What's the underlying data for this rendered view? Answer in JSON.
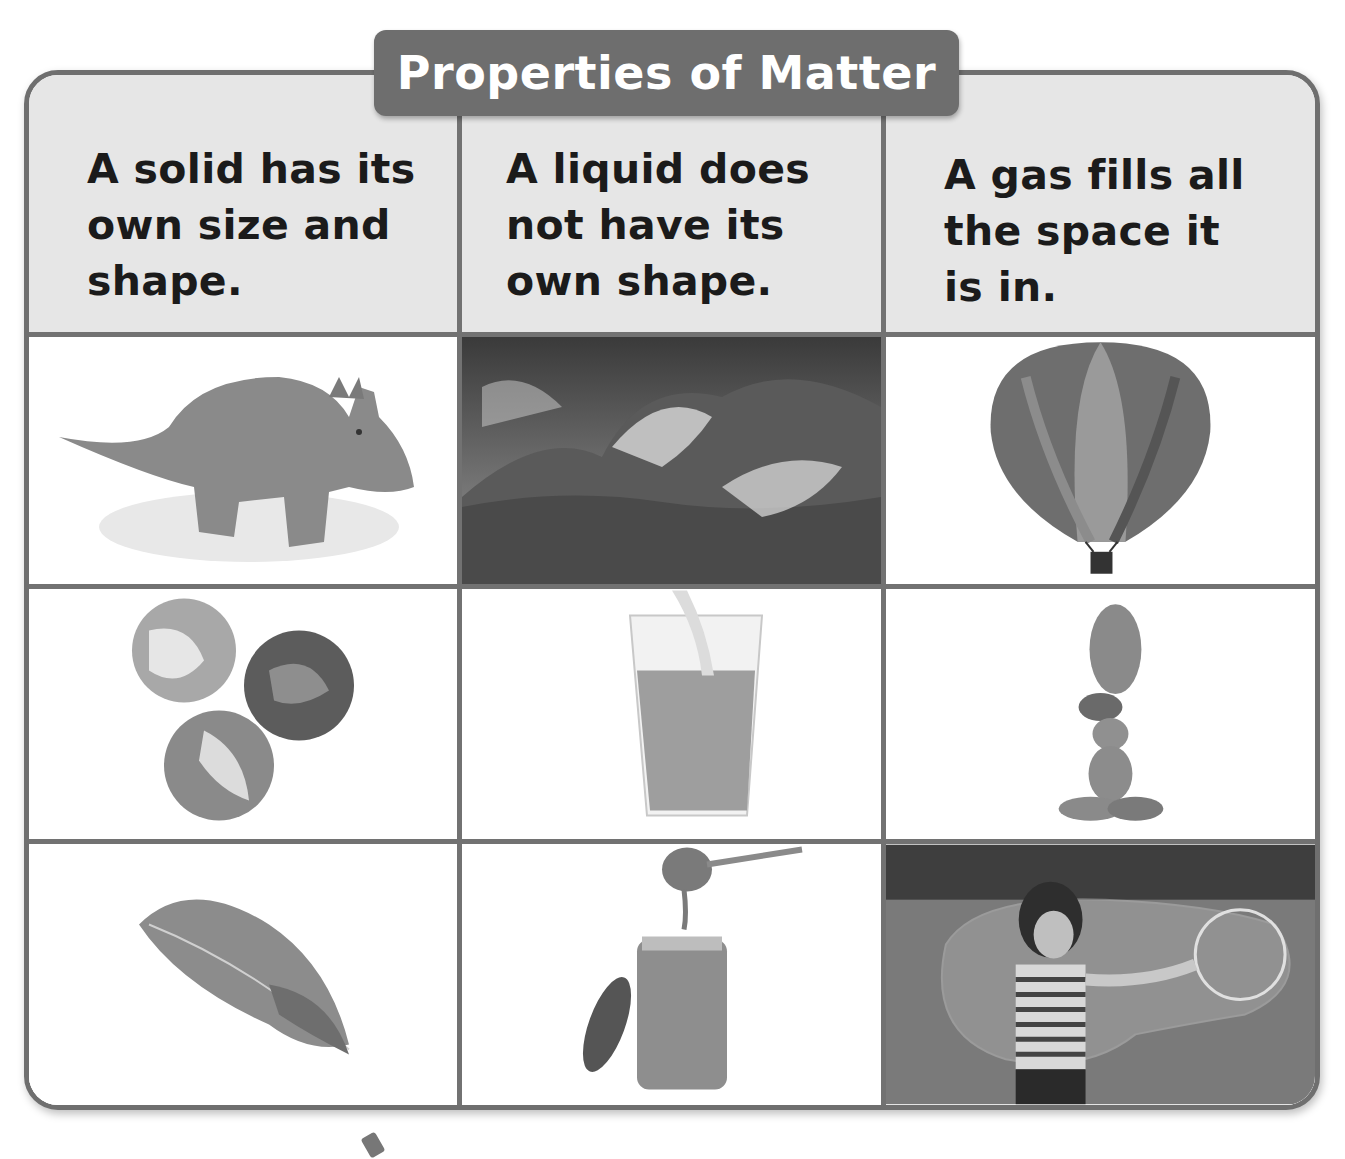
{
  "title": "Properties of Matter",
  "columns": [
    {
      "key": "solid",
      "header": "A solid has its\nown size and\nshape.",
      "images": [
        {
          "name": "toy-dinosaur-image",
          "subject": "toy triceratops dinosaur"
        },
        {
          "name": "marbles-image",
          "subject": "three glass marbles"
        },
        {
          "name": "feather-image",
          "subject": "feather"
        }
      ]
    },
    {
      "key": "liquid",
      "header": "A liquid does\nnot have its\nown shape.",
      "images": [
        {
          "name": "ocean-wave-image",
          "subject": "crashing ocean wave"
        },
        {
          "name": "juice-glass-image",
          "subject": "juice being poured into a glass"
        },
        {
          "name": "honey-jar-image",
          "subject": "honey dripping from dipper into jar"
        }
      ]
    },
    {
      "key": "gas",
      "header": "A gas fills all\nthe space it\nis in.",
      "images": [
        {
          "name": "hot-air-balloon-image",
          "subject": "hot air balloon"
        },
        {
          "name": "balloon-animal-image",
          "subject": "balloon animal"
        },
        {
          "name": "giant-bubble-image",
          "subject": "girl making a giant soap bubble"
        }
      ]
    }
  ],
  "colors": {
    "frame": "#6f6f6f",
    "title_bg": "#6e6e6e",
    "title_text": "#ffffff",
    "header_bg": "#e6e6e6",
    "header_text": "#1b1b1b",
    "grid_line": "#727272"
  }
}
